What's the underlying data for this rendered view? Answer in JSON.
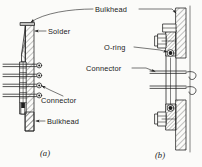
{
  "figure": {
    "background_color": "#fbfbf9",
    "ink_color": "#1d1d1d",
    "labels": {
      "bulkhead_top": "Bulkhead",
      "solder": "Solder",
      "o_ring": "O-ring",
      "connector_right": "Connector",
      "connector_left": "Connector",
      "bulkhead_bottom": "Bulkhead"
    },
    "captions": {
      "left": "(a)",
      "right": "(b)"
    },
    "panels": [
      {
        "id": "a",
        "caption": "(a)",
        "description": "Soldered bulkhead connector with four wire terminals",
        "callouts": [
          "Solder",
          "Connector",
          "Bulkhead"
        ],
        "terminal_count": 4
      },
      {
        "id": "b",
        "caption": "(b)",
        "description": "Bolted flange bulkhead connector with O-ring seal",
        "callouts": [
          "Bulkhead",
          "O-ring",
          "Connector"
        ],
        "terminal_count": 2
      }
    ]
  }
}
